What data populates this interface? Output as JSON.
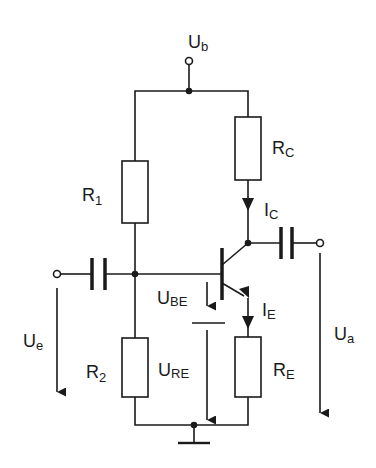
{
  "diagram": {
    "type": "circuit-schematic",
    "colors": {
      "line": "#1a1a1a",
      "background": "#ffffff"
    },
    "labels": {
      "supply": {
        "main": "U",
        "sub": "b"
      },
      "r1": {
        "main": "R",
        "sub": "1"
      },
      "rc": {
        "main": "R",
        "sub": "C"
      },
      "ic": {
        "main": "I",
        "sub": "C"
      },
      "ie": {
        "main": "I",
        "sub": "E"
      },
      "ube": {
        "main": "U",
        "sub": "BE"
      },
      "ure": {
        "main": "U",
        "sub": "RE"
      },
      "r2": {
        "main": "R",
        "sub": "2"
      },
      "re": {
        "main": "R",
        "sub": "E"
      },
      "ue": {
        "main": "U",
        "sub": "e"
      },
      "ua": {
        "main": "U",
        "sub": "a"
      }
    },
    "components": [
      {
        "id": "R1",
        "kind": "resistor"
      },
      {
        "id": "R2",
        "kind": "resistor"
      },
      {
        "id": "RC",
        "kind": "resistor"
      },
      {
        "id": "RE",
        "kind": "resistor"
      },
      {
        "id": "C_in",
        "kind": "capacitor"
      },
      {
        "id": "C_out",
        "kind": "capacitor"
      },
      {
        "id": "T1",
        "kind": "npn-transistor"
      },
      {
        "id": "GND",
        "kind": "ground"
      }
    ]
  }
}
